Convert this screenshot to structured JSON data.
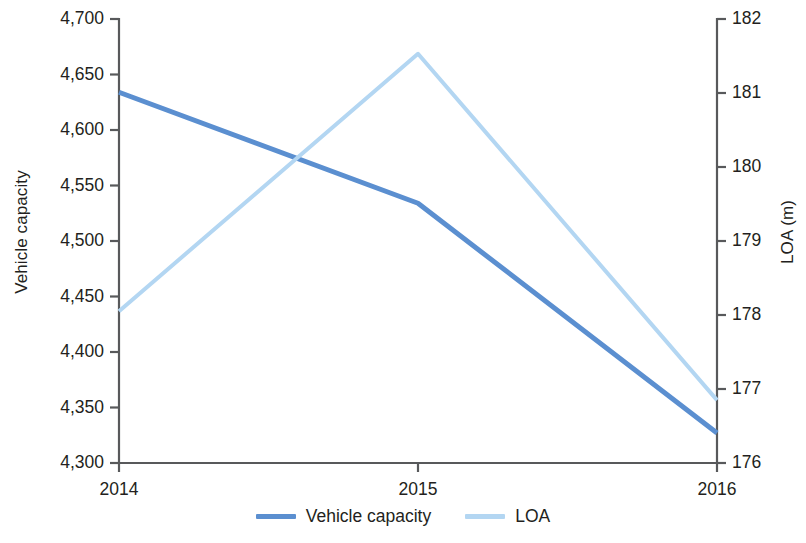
{
  "chart_data": {
    "type": "line",
    "title": "",
    "xlabel": "",
    "ylabel": "Vehicle capacity",
    "y2label": "LOA (m)",
    "categories": [
      "2014",
      "2015",
      "2016"
    ],
    "x": [
      2014,
      2015,
      2016
    ],
    "grid": false,
    "legend_position": "bottom",
    "ylim": [
      4300,
      4700
    ],
    "ytick_step": 50,
    "y2lim": [
      176,
      182
    ],
    "y2tick_step": 1,
    "yticks": [
      "4,300",
      "4,350",
      "4,400",
      "4,450",
      "4,500",
      "4,550",
      "4,600",
      "4,650",
      "4,700"
    ],
    "ytick_values": [
      4300,
      4350,
      4400,
      4450,
      4500,
      4550,
      4600,
      4650,
      4700
    ],
    "y2ticks": [
      "176",
      "177",
      "178",
      "179",
      "180",
      "181",
      "182"
    ],
    "y2tick_values": [
      176,
      177,
      178,
      179,
      180,
      181,
      182
    ],
    "series": [
      {
        "name": "Vehicle capacity",
        "axis": "left",
        "color": "#5b8fd0",
        "width": 5,
        "values": [
          4634,
          4534,
          4327
        ]
      },
      {
        "name": "LOA",
        "axis": "right",
        "color": "#b3d6f2",
        "width": 4,
        "values": [
          178.05,
          181.53,
          176.85
        ]
      }
    ]
  },
  "legend": {
    "items": [
      {
        "label": "Vehicle capacity",
        "color": "#5b8fd0"
      },
      {
        "label": "LOA",
        "color": "#b3d6f2"
      }
    ]
  },
  "axes": {
    "left_title": "Vehicle capacity",
    "right_title": "LOA (m)"
  }
}
